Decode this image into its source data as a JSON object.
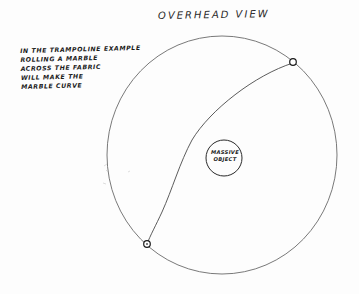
{
  "diagram": {
    "title": "OVERHEAD VIEW",
    "annotation": {
      "lines": [
        "IN THE TRAMPOLINE EXAMPLE",
        "ROLLING A MARBLE",
        "ACROSS THE FABRIC",
        "WILL MAKE THE",
        "MARBLE CURVE"
      ]
    },
    "central_object": {
      "label_lines": [
        "MASSIVE",
        "OBJECT"
      ]
    },
    "elements": {
      "fabric_boundary": "large circle (trampoline fabric)",
      "massive_object": "small circle in center",
      "marble_start": "small circle at upper right on boundary",
      "marble_end": "small circle at lower left on boundary",
      "marble_path": "curved line bending around massive object"
    },
    "colors": {
      "ink": "#3a3a3a",
      "paper": "#fdfdfd"
    }
  }
}
